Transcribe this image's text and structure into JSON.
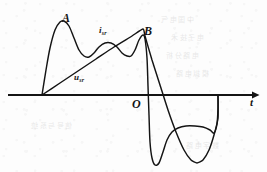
{
  "figure": {
    "kind": "hand-drawn-waveform-diagram",
    "background_color": "#fdfdfd",
    "ink_color": "#141414",
    "labels": {
      "peak_a": "A",
      "peak_b": "B",
      "origin": "O",
      "axis_t": "t",
      "current_symbol": "i",
      "current_subscript": "sr",
      "voltage_symbol": "u",
      "voltage_subscript": "sr"
    },
    "bleed_through": {
      "line_1": "中国电气",
      "line_2": "电子技术",
      "line_3": "电路分析",
      "line_4": "模拟电路",
      "line_5": "信号与系统",
      "line_6": "数字电路"
    }
  },
  "chart_data": {
    "type": "line",
    "title": "",
    "xlabel": "t",
    "ylabel": "",
    "grid": false,
    "legend": "inline-annotations",
    "axes": {
      "x_axis_y_px": 95,
      "x_axis_start_px": 8,
      "x_axis_end_px": 255,
      "arrowhead": "right",
      "origin_label": "O",
      "origin_x_px": 143
    },
    "annotations": [
      {
        "text": "A",
        "x_px": 62,
        "y_px": 17,
        "refers_to": "first-peak-of-i-sr"
      },
      {
        "text": "i_sr",
        "x_px": 99,
        "y_px": 31,
        "refers_to": "current-waveform"
      },
      {
        "text": "B",
        "x_px": 144,
        "y_px": 30,
        "refers_to": "second-peak-of-i-sr"
      },
      {
        "text": "u_sr",
        "x_px": 76,
        "y_px": 77,
        "refers_to": "voltage-waveform"
      },
      {
        "text": "O",
        "x_px": 133,
        "y_px": 101,
        "refers_to": "origin"
      },
      {
        "text": "t",
        "x_px": 251,
        "y_px": 101,
        "refers_to": "time-axis"
      }
    ],
    "series": [
      {
        "name": "i_sr",
        "description": "Current waveform: sharp spike to peak A, plateau, broad rounded hump, second sharp spike to peak B, steep drop below axis to deep trough, shallow negative plateau, return to axis.",
        "points_px": [
          [
            42,
            95
          ],
          [
            46,
            70
          ],
          [
            50,
            48
          ],
          [
            55,
            30
          ],
          [
            60,
            22
          ],
          [
            64,
            21
          ],
          [
            69,
            26
          ],
          [
            74,
            38
          ],
          [
            79,
            50
          ],
          [
            84,
            56
          ],
          [
            89,
            57
          ],
          [
            94,
            53
          ],
          [
            99,
            47
          ],
          [
            105,
            43
          ],
          [
            111,
            43
          ],
          [
            117,
            47
          ],
          [
            122,
            53
          ],
          [
            127,
            56
          ],
          [
            131,
            56
          ],
          [
            135,
            50
          ],
          [
            139,
            40
          ],
          [
            143,
            35
          ],
          [
            145,
            39
          ],
          [
            147,
            58
          ],
          [
            148,
            86
          ],
          [
            149,
            115
          ],
          [
            150,
            142
          ],
          [
            152,
            158
          ],
          [
            155,
            165
          ],
          [
            159,
            163
          ],
          [
            163,
            152
          ],
          [
            167,
            140
          ],
          [
            172,
            132
          ],
          [
            178,
            128
          ],
          [
            186,
            126
          ],
          [
            195,
            126
          ],
          [
            203,
            127
          ],
          [
            210,
            130
          ],
          [
            214,
            133
          ],
          [
            217,
            124
          ],
          [
            218,
            108
          ],
          [
            218,
            96
          ]
        ]
      },
      {
        "name": "u_sr",
        "description": "Voltage waveform: straight rising ramp from start to origin O, then straight descending ramp to a rounded trough, then rising back to the axis.",
        "points_px": [
          [
            42,
            95
          ],
          [
            60,
            83
          ],
          [
            78,
            71
          ],
          [
            96,
            59
          ],
          [
            114,
            47
          ],
          [
            132,
            36
          ],
          [
            143,
            29
          ],
          [
            145,
            36
          ],
          [
            152,
            60
          ],
          [
            160,
            85
          ],
          [
            168,
            110
          ],
          [
            176,
            132
          ],
          [
            184,
            150
          ],
          [
            191,
            160
          ],
          [
            197,
            163
          ],
          [
            203,
            160
          ],
          [
            209,
            150
          ],
          [
            214,
            135
          ],
          [
            218,
            118
          ],
          [
            218,
            96
          ]
        ]
      }
    ]
  }
}
